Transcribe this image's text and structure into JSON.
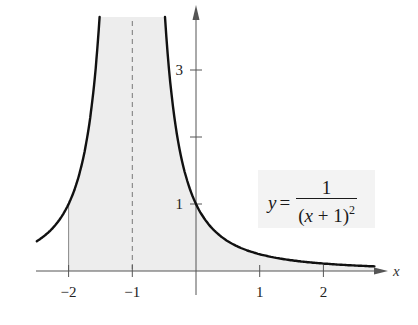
{
  "chart_data": {
    "type": "area",
    "title": "",
    "function": "y = 1/(x+1)^2",
    "equation_label": {
      "lhs": "y",
      "equals": "=",
      "numerator": "1",
      "denominator_open": "(",
      "denominator_var": "x",
      "denominator_rest": " + 1)",
      "exponent": "2"
    },
    "xlabel": "x",
    "ylabel": "",
    "xlim": [
      -2.5,
      2.8
    ],
    "ylim": [
      0,
      3.8
    ],
    "x_ticks": [
      {
        "value": -2,
        "label": "−2"
      },
      {
        "value": -1,
        "label": "−1"
      },
      {
        "value": 1,
        "label": "1"
      },
      {
        "value": 2,
        "label": "2"
      }
    ],
    "y_ticks": [
      {
        "value": 1,
        "label": "1"
      },
      {
        "value": 2,
        "label": ""
      },
      {
        "value": 3,
        "label": "3"
      }
    ],
    "vertical_asymptote": {
      "x": -1,
      "style": "dashed"
    },
    "shaded_region": {
      "x_from": -2,
      "x_to": 2.8,
      "note": "area under curve, unbounded near x = -1"
    },
    "sample_points": [
      {
        "x": -2.5,
        "y": 0.444
      },
      {
        "x": -2,
        "y": 1
      },
      {
        "x": -1.5,
        "y": 4
      },
      {
        "x": -0.5,
        "y": 4
      },
      {
        "x": 0,
        "y": 1
      },
      {
        "x": 1,
        "y": 0.25
      },
      {
        "x": 2,
        "y": 0.111
      },
      {
        "x": 2.8,
        "y": 0.069
      }
    ],
    "grid": false,
    "legend": null,
    "colors": {
      "curve": "#111111",
      "shade": "#ededed",
      "axis": "#555555",
      "asymptote": "#777777"
    }
  }
}
